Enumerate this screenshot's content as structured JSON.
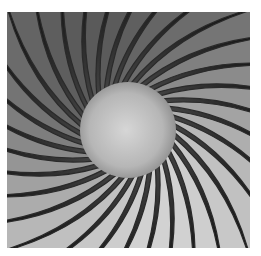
{
  "image": {
    "subject": "radial fan blades around a glowing central hub, grayscale",
    "blade_count": 32,
    "colors": {
      "background": "#ffffff",
      "dark": "#111111",
      "blade_light": "#d8d8d8",
      "blade_mid": "#8a8a8a",
      "hub_center": "#d4d4d4",
      "hub_edge": "#9a9a9a"
    }
  }
}
